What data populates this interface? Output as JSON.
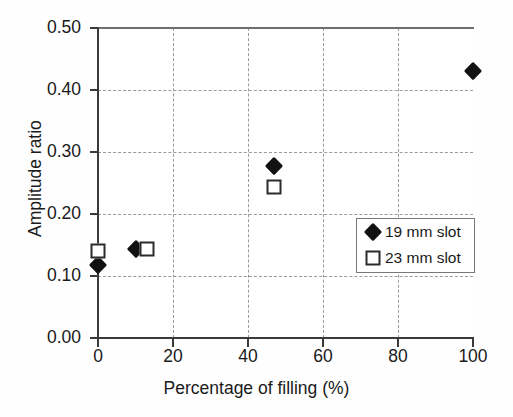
{
  "chart_data": {
    "type": "scatter",
    "title": "",
    "xlabel": "Percentage of filling (%)",
    "ylabel": "Amplitude ratio",
    "xlim": [
      0,
      100
    ],
    "ylim": [
      0.0,
      0.5
    ],
    "xticks": [
      "0",
      "20",
      "40",
      "60",
      "80",
      "100"
    ],
    "yticks": [
      "0.00",
      "0.10",
      "0.20",
      "0.30",
      "0.40",
      "0.50"
    ],
    "grid": "dashed gray gridlines at every major x and y tick",
    "legend_position": "inside lower right",
    "series": [
      {
        "name": "19 mm slot",
        "marker": "filled-diamond",
        "color": "#121212",
        "points": [
          {
            "x": 0,
            "y": 0.117
          },
          {
            "x": 10,
            "y": 0.143
          },
          {
            "x": 47,
            "y": 0.278
          },
          {
            "x": 100,
            "y": 0.43
          }
        ]
      },
      {
        "name": "23 mm slot",
        "marker": "open-square",
        "color": "#2b2b2b",
        "points": [
          {
            "x": 0,
            "y": 0.14
          },
          {
            "x": 13,
            "y": 0.143
          },
          {
            "x": 47,
            "y": 0.243
          }
        ]
      }
    ]
  },
  "legend": {
    "entries": [
      {
        "label": "19 mm slot",
        "marker": "filled-diamond"
      },
      {
        "label": "23 mm slot",
        "marker": "open-square"
      }
    ]
  },
  "colors": {
    "axis": "#3a3a3a",
    "grid": "#9a9a9a",
    "marker_fill": "#121212",
    "marker_outline": "#2b2b2b",
    "background": "#fefefe"
  }
}
